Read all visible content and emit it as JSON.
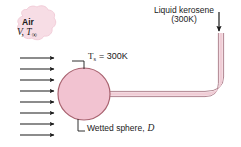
{
  "figure": {
    "background_color": "#ffffff"
  },
  "labels": {
    "air": "Air",
    "air_velocity_temp": "V, T",
    "air_temp_subscript": "∞",
    "surface_temp_symbol": "T",
    "surface_temp_subscript": "s",
    "surface_temp_value": "= 300K",
    "wetted_sphere": "Wetted sphere,",
    "wetted_sphere_symbol": "D",
    "kerosene_line1": "Liquid kerosene",
    "kerosene_line2": "(300K)"
  },
  "colors": {
    "sphere_fill": "#f2c3d1",
    "sphere_stroke": "#a8626f",
    "tube_fill": "#f0cdd6",
    "tube_stroke": "#b08490",
    "cloud_fill": "#f7dde5",
    "cloud_stroke": "#f0c9d6",
    "arrow": "#1a1a1a",
    "text": "#1a1a1a",
    "leader": "#1a1a1a"
  },
  "geometry": {
    "sphere_center_x": 84,
    "sphere_center_y": 94,
    "sphere_radius": 26,
    "flow_arrow_count": 8,
    "flow_arrow_x_start": 20,
    "flow_arrow_x_end": 57,
    "flow_arrow_y_first": 58,
    "flow_arrow_spacing": 11,
    "tube_vertical_x": 222,
    "tube_top_y": 33,
    "tube_horizontal_y": 94,
    "kerosene_arrow_x": 219,
    "kerosene_arrow_y_top": 12,
    "kerosene_arrow_y_bottom": 33
  },
  "icons": {
    "flow_arrow": "right-arrow-icon",
    "kerosene_arrow": "down-arrow-icon"
  }
}
